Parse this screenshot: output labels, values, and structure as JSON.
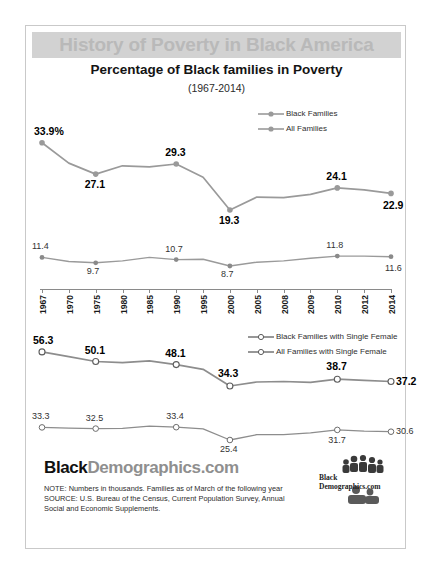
{
  "poster": {
    "banner_title": "History of Poverty in Black America",
    "subtitle": "Percentage of Black families in Poverty",
    "year_range": "(1967-2014)",
    "accent_gray": "#d2d2d2",
    "title_text_color": "#b9b9b9",
    "line_color": "#8f8f8f"
  },
  "brand": {
    "part_bold": "Black",
    "part_light": "Demographics.com"
  },
  "logo": {
    "name": "black-demographics-logo",
    "line1": "Black",
    "line2": "Demographics.com"
  },
  "footer": {
    "note": "NOTE:  Numbers in thousands. Families  as of March of the following year",
    "source": "SOURCE:  U.S. Bureau of the Census, Current Population Survey, Annual Social and Economic  Supplements."
  },
  "axis": {
    "years": [
      "1967",
      "1970",
      "1975",
      "1980",
      "1985",
      "1990",
      "1995",
      "2000",
      "2005",
      "2008",
      "2009",
      "2010",
      "2012",
      "2014"
    ]
  },
  "chart_data": [
    {
      "type": "line",
      "title": "Percentage of Black families in Poverty",
      "subtitle": "(1967-2014)",
      "xlabel": "",
      "ylabel": "",
      "grid": false,
      "legend_position": "top-right",
      "x": [
        "1967",
        "1970",
        "1975",
        "1980",
        "1985",
        "1990",
        "1995",
        "2000",
        "2005",
        "2008",
        "2009",
        "2010",
        "2012",
        "2014"
      ],
      "ylim": [
        0,
        60
      ],
      "series": [
        {
          "name": "Black Families",
          "values": [
            33.9,
            29.5,
            27.1,
            28.9,
            28.7,
            29.3,
            26.4,
            19.3,
            22.1,
            22.0,
            22.7,
            24.1,
            23.7,
            22.9
          ],
          "labels": [
            {
              "x": "1967",
              "value": "33.9%",
              "emphasis": "bold"
            },
            {
              "x": "1975",
              "value": "27.1",
              "emphasis": "bold"
            },
            {
              "x": "1990",
              "value": "29.3",
              "emphasis": "bold"
            },
            {
              "x": "2000",
              "value": "19.3",
              "emphasis": "bold"
            },
            {
              "x": "2010",
              "value": "24.1",
              "emphasis": "bold"
            },
            {
              "x": "2014",
              "value": "22.9",
              "emphasis": "bold"
            }
          ]
        },
        {
          "name": "All Families",
          "values": [
            11.4,
            10.1,
            9.7,
            10.3,
            11.4,
            10.7,
            10.8,
            8.7,
            9.9,
            10.3,
            11.1,
            11.8,
            11.8,
            11.6
          ],
          "labels": [
            {
              "x": "1967",
              "value": "11.4",
              "emphasis": "light"
            },
            {
              "x": "1975",
              "value": "9.7",
              "emphasis": "light"
            },
            {
              "x": "1990",
              "value": "10.7",
              "emphasis": "light"
            },
            {
              "x": "2000",
              "value": "8.7",
              "emphasis": "light"
            },
            {
              "x": "2010",
              "value": "11.8",
              "emphasis": "light"
            },
            {
              "x": "2014",
              "value": "11.6",
              "emphasis": "light"
            }
          ]
        }
      ]
    },
    {
      "type": "line",
      "title": "",
      "xlabel": "",
      "ylabel": "",
      "grid": false,
      "legend_position": "top-right",
      "x": [
        "1967",
        "1970",
        "1975",
        "1980",
        "1985",
        "1990",
        "1995",
        "2000",
        "2005",
        "2008",
        "2009",
        "2010",
        "2012",
        "2014"
      ],
      "ylim": [
        0,
        60
      ],
      "series": [
        {
          "name": "Black Families with Single Female",
          "values": [
            56.3,
            53.2,
            50.1,
            49.4,
            50.5,
            48.1,
            45.1,
            34.3,
            36.9,
            37.2,
            36.7,
            38.7,
            38.0,
            37.2
          ],
          "labels": [
            {
              "x": "1967",
              "value": "56.3",
              "emphasis": "bold"
            },
            {
              "x": "1975",
              "value": "50.1",
              "emphasis": "bold"
            },
            {
              "x": "1990",
              "value": "48.1",
              "emphasis": "bold"
            },
            {
              "x": "2000",
              "value": "34.3",
              "emphasis": "bold"
            },
            {
              "x": "2010",
              "value": "38.7",
              "emphasis": "bold"
            },
            {
              "x": "2014",
              "value": "37.2",
              "emphasis": "bold"
            }
          ]
        },
        {
          "name": "All Families with Single Female",
          "values": [
            33.3,
            32.8,
            32.5,
            32.7,
            34.0,
            33.4,
            32.4,
            25.4,
            28.7,
            28.7,
            29.9,
            31.7,
            30.9,
            30.6
          ],
          "labels": [
            {
              "x": "1967",
              "value": "33.3",
              "emphasis": "light"
            },
            {
              "x": "1975",
              "value": "32.5",
              "emphasis": "light"
            },
            {
              "x": "1990",
              "value": "33.4",
              "emphasis": "light"
            },
            {
              "x": "2000",
              "value": "25.4",
              "emphasis": "light"
            },
            {
              "x": "2010",
              "value": "31.7",
              "emphasis": "light"
            },
            {
              "x": "2014",
              "value": "30.6",
              "emphasis": "light"
            }
          ]
        }
      ]
    }
  ]
}
